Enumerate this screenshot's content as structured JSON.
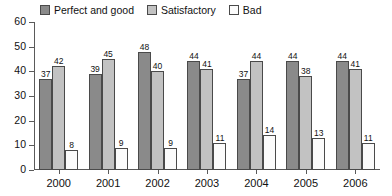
{
  "chart_data": {
    "type": "bar",
    "title": "",
    "subtitle": "",
    "xlabel": "",
    "ylabel": "",
    "categories": [
      "2000",
      "2001",
      "2002",
      "2003",
      "2004",
      "2005",
      "2006"
    ],
    "series": [
      {
        "name": "Perfect and good",
        "color": "#8a8a8a",
        "values": [
          37,
          39,
          48,
          44,
          37,
          44,
          44
        ]
      },
      {
        "name": "Satisfactory",
        "color": "#c2c2c2",
        "values": [
          42,
          45,
          40,
          41,
          44,
          38,
          41
        ]
      },
      {
        "name": "Bad",
        "color": "#fbfbfb",
        "values": [
          8,
          9,
          9,
          11,
          14,
          13,
          11
        ]
      }
    ],
    "ylim": [
      0,
      60
    ],
    "ytick_values": [
      60,
      50,
      40,
      30,
      20,
      10,
      0
    ],
    "ytick_labels": [
      "60",
      "50",
      "40",
      "30",
      "20",
      "10",
      "0"
    ],
    "grid": false,
    "legend_position": "top",
    "data_labels": true,
    "axis_color": "#5a5a5a",
    "bar_border_color": "#4a4a4a"
  }
}
